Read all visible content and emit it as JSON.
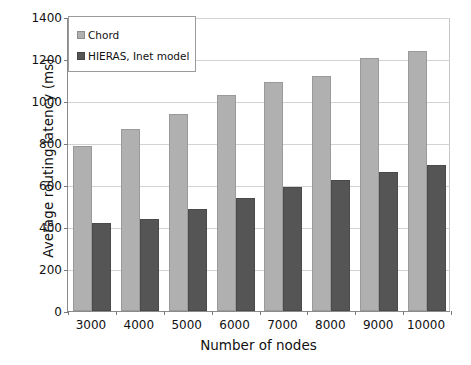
{
  "chart_data": {
    "type": "bar",
    "title": "",
    "xlabel": "Number of nodes",
    "ylabel": "Average routing latency (ms)",
    "categories": [
      "3000",
      "4000",
      "5000",
      "6000",
      "7000",
      "8000",
      "9000",
      "10000"
    ],
    "series": [
      {
        "name": "Chord",
        "color": "#b0b0b0",
        "values": [
          785,
          865,
          940,
          1030,
          1090,
          1120,
          1205,
          1240
        ]
      },
      {
        "name": "HIERAS, Inet model",
        "color": "#555555",
        "values": [
          418,
          440,
          488,
          540,
          592,
          625,
          662,
          695
        ]
      }
    ],
    "ylim": [
      0,
      1400
    ],
    "ytick_values": [
      "0",
      "200",
      "400",
      "600",
      "800",
      "1000",
      "1200",
      "1400"
    ],
    "ytick_step": 200,
    "grid": true,
    "legend_position": "top-left"
  },
  "legend": {
    "items": [
      {
        "label": "Chord",
        "swatch": "chord-swatch"
      },
      {
        "label": "HIERAS, Inet model",
        "swatch": "hieras-swatch"
      }
    ]
  }
}
